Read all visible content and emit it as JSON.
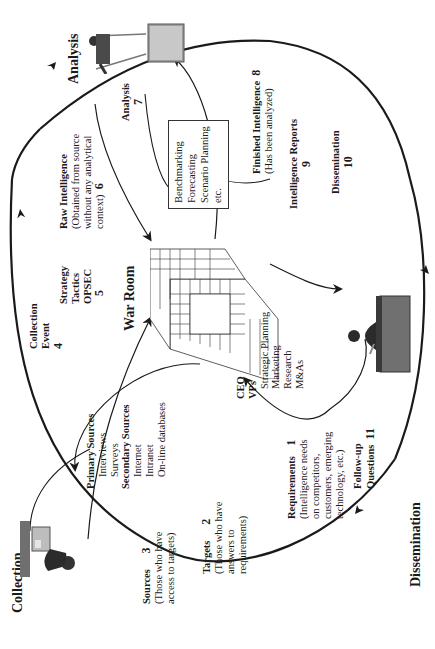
{
  "stages": {
    "collection": "Collection",
    "analysis": "Analysis",
    "dissemination": "Dissemination"
  },
  "center": {
    "war_room": "War Room"
  },
  "steps": {
    "requirements": {
      "title": "Requirements",
      "number": "1",
      "lines": [
        "(Intelligence needs",
        "on competitors,",
        "customers, emerging",
        "technology, etc.)"
      ]
    },
    "targets": {
      "title": "Targets",
      "number": "2",
      "lines": [
        "(Those who have",
        "answers to",
        "requirements)"
      ]
    },
    "sources": {
      "title": "Sources",
      "number": "3",
      "lines": [
        "(Those who have",
        "access to targets)"
      ]
    },
    "collection_event": {
      "title": "Collection",
      "title2": "Event",
      "number": "4"
    },
    "strategy": {
      "lines": [
        "Strategy",
        "Tactics",
        "OPSEC"
      ],
      "number": "5"
    },
    "raw_intelligence": {
      "title": "Raw Intelligence",
      "number": "6",
      "lines": [
        "(Obtained from source",
        "without any analytical",
        "context)"
      ]
    },
    "analysis_step": {
      "title": "Analysis",
      "number": "7"
    },
    "finished_intelligence": {
      "title": "Finished Intelligence",
      "number": "8",
      "sub": "(Has been analyzed)"
    },
    "intelligence_reports": {
      "title": "Intelligence Reports",
      "number": "9"
    },
    "dissemination_step": {
      "title": "Dissemination",
      "number": "10"
    },
    "follow_up": {
      "title": "Follow-up",
      "title2": "Questions",
      "number": "11"
    }
  },
  "sources_list": {
    "primary_title": "Primary Sources",
    "primary_items": [
      "Interviews",
      "Surveys"
    ],
    "secondary_title": "Secondary Sources",
    "secondary_items": [
      "Internet",
      "Intranet",
      "On-line databases"
    ]
  },
  "analysis_box": {
    "items": [
      "Benchmarking",
      "Forecasting",
      "Scenario Planning",
      "etc."
    ]
  },
  "recipients": {
    "bold_items": [
      "CEO",
      "VPs"
    ],
    "items": [
      "Strategic Planning",
      "Marketing",
      "Research",
      "M&As"
    ]
  },
  "icons": {
    "collection_figure": "person-at-desk-with-computer",
    "analysis_figure": "person-presenting-at-board",
    "dissemination_figure": "executive-at-desk",
    "war_room_figure": "grid-room"
  }
}
